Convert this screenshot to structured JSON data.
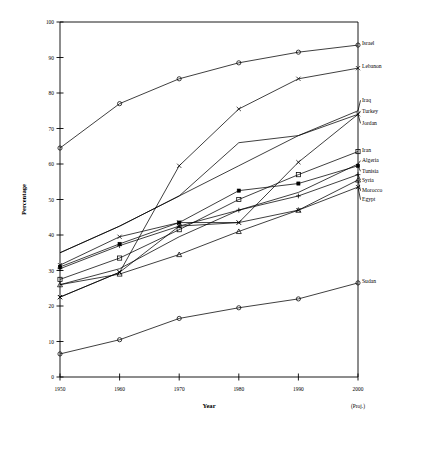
{
  "chart_data": {
    "type": "line",
    "title": "",
    "xlabel": "Year",
    "ylabel": "Percentage",
    "x": [
      1950,
      1960,
      1970,
      1980,
      1990,
      2000
    ],
    "xtick_labels": [
      "1950",
      "1960",
      "1970",
      "1980",
      "1990",
      "2000"
    ],
    "x_note": "(Proj.)",
    "ytick_labels": [
      "0",
      "10",
      "20",
      "30",
      "40",
      "50",
      "60",
      "70",
      "80",
      "90",
      "100"
    ],
    "ylim": [
      0,
      100
    ],
    "xlim": [
      1950,
      2000
    ],
    "grid": false,
    "legend_position": "right-inline-labels",
    "series": [
      {
        "name": "Israel",
        "marker": "open-circle",
        "values": [
          64.5,
          77.0,
          84.0,
          88.5,
          91.5,
          93.5
        ]
      },
      {
        "name": "Lebanon",
        "marker": "x",
        "values": [
          22.5,
          29.5,
          59.5,
          75.5,
          84.0,
          87.0
        ]
      },
      {
        "name": "Iraq",
        "marker": "none",
        "values": [
          35.0,
          42.5,
          51.0,
          66.0,
          68.0,
          75.0
        ]
      },
      {
        "name": "Turkey",
        "marker": "x",
        "values": [
          31.5,
          39.5,
          43.5,
          43.5,
          60.5,
          74.0
        ]
      },
      {
        "name": "Jordan",
        "marker": "none",
        "values": [
          35.0,
          42.5,
          51.0,
          59.5,
          68.0,
          74.0
        ]
      },
      {
        "name": "Iran",
        "marker": "open-square",
        "values": [
          27.5,
          33.5,
          41.5,
          50.0,
          57.0,
          63.5
        ]
      },
      {
        "name": "Algeria",
        "marker": "none",
        "values": [
          26.0,
          30.5,
          39.5,
          47.0,
          52.0,
          60.0
        ]
      },
      {
        "name": "Tunisia",
        "marker": "filled-square",
        "values": [
          31.0,
          37.5,
          43.5,
          52.5,
          54.5,
          59.5
        ]
      },
      {
        "name": "Syria",
        "marker": "plus",
        "values": [
          30.5,
          37.0,
          42.5,
          47.0,
          51.0,
          57.0
        ]
      },
      {
        "name": "Morocco",
        "marker": "open-triangle",
        "values": [
          26.0,
          29.0,
          34.5,
          41.0,
          47.0,
          55.5
        ]
      },
      {
        "name": "Egypt",
        "marker": "x",
        "values": [
          22.5,
          29.5,
          42.5,
          43.5,
          47.0,
          53.5
        ]
      },
      {
        "name": "Sudan",
        "marker": "open-circle",
        "values": [
          6.5,
          10.5,
          16.5,
          19.5,
          22.0,
          26.5
        ]
      }
    ],
    "series_end_labels": [
      {
        "name": "Israel",
        "y": 93.5
      },
      {
        "name": "Lebanon",
        "y": 87.0
      },
      {
        "name": "Iraq",
        "y": 77.5
      },
      {
        "name": "Turkey",
        "y": 74.5
      },
      {
        "name": "Jordan",
        "y": 71.0
      },
      {
        "name": "Iran",
        "y": 63.5
      },
      {
        "name": "Algeria",
        "y": 60.5
      },
      {
        "name": "Tunisia",
        "y": 57.5
      },
      {
        "name": "Syria",
        "y": 55.0
      },
      {
        "name": "Morocco",
        "y": 52.0
      },
      {
        "name": "Egypt",
        "y": 49.5
      },
      {
        "name": "Sudan",
        "y": 26.5
      }
    ]
  },
  "caption": ""
}
